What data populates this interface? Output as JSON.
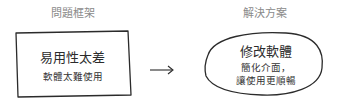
{
  "problem": {
    "heading": "問題框架",
    "title": "易用性太差",
    "description": "軟體太難使用"
  },
  "solution": {
    "heading": "解決方案",
    "title": "修改軟體",
    "description_line1": "簡化介面，",
    "description_line2": "讓使用更順暢"
  },
  "connector": {
    "icon": "right-arrow-icon"
  }
}
